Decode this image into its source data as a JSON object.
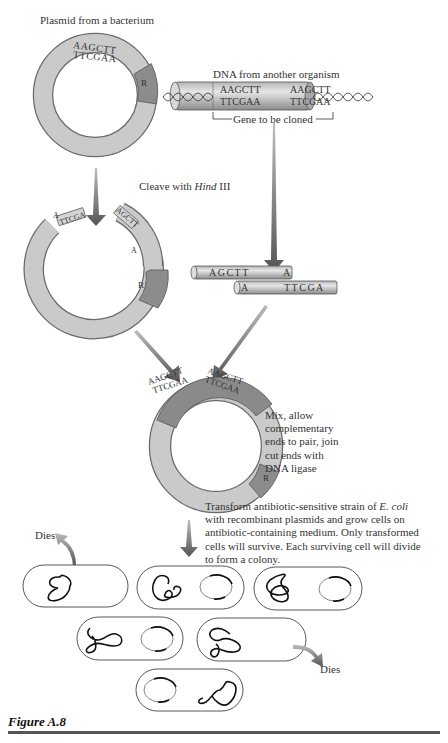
{
  "labels": {
    "plasmid_title": "Plasmid from a bacterium",
    "foreign_dna_title": "DNA from another organism",
    "gene_to_clone": "Gene to be cloned",
    "cleave_prefix": "Cleave with ",
    "cleave_enzyme": "Hind",
    "cleave_suffix": " III",
    "mix_text": [
      "Mix, allow",
      "complementary",
      "ends to pair, join",
      "cut ends with",
      "DNA ligase"
    ],
    "transform_lines": [
      "Transform antibiotic-sensitive strain of ",
      "E. coli",
      "with recombinant plasmids and grow cells on",
      "antibiotic-containing medium.  Only transformed",
      "cells will survive.  Each surviving cell will divide",
      "to form a colony."
    ],
    "dies_1": "Dies",
    "dies_2": "Dies",
    "resistance_marker": "R",
    "figure_caption": "Figure A.8"
  },
  "sequences": {
    "plasmid_top": "AAGCTT",
    "plasmid_bottom": "TTCGAA",
    "foreign_left_top": "AAGCTT",
    "foreign_left_bottom": "TTCGAA",
    "foreign_right_top": "AAGCTT",
    "foreign_right_bottom": "TTCGAA",
    "cut_plasmid_left": "TTCGA",
    "cut_plasmid_left_overhang": "A",
    "cut_plasmid_right": "AGCTT",
    "cut_plasmid_right_overhang": "A",
    "fragment_top": "AGCTT",
    "fragment_top_end": "A",
    "fragment_bottom_start": "A",
    "fragment_bottom": "TTCGA",
    "recombinant_left_top": "AAGCTT",
    "recombinant_left_bottom": "TTCGAA",
    "recombinant_right_top": "AAGCTT",
    "recombinant_right_bottom": "TTCGAA"
  },
  "colors": {
    "plasmid_ring": "#c8c8c8",
    "resistance_segment": "#8a8a8a",
    "insert_segment": "#7a7a7a",
    "arrow": "#666666",
    "outline": "#555555"
  },
  "cells": [
    {
      "id": 1,
      "has_plasmid": false,
      "fate": "dies"
    },
    {
      "id": 2,
      "has_plasmid": true,
      "fate": "survives"
    },
    {
      "id": 3,
      "has_plasmid": true,
      "fate": "survives"
    },
    {
      "id": 4,
      "has_plasmid": true,
      "fate": "survives"
    },
    {
      "id": 5,
      "has_plasmid": false,
      "fate": "dies"
    },
    {
      "id": 6,
      "has_plasmid": true,
      "fate": "survives"
    }
  ]
}
